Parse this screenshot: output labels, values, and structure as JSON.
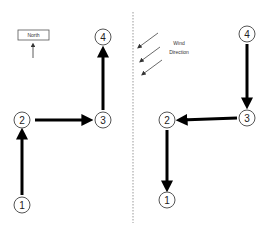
{
  "legend": {
    "north_label": "North",
    "wind_line1": "Wind",
    "wind_line2": "Direction"
  },
  "left_diagram": {
    "nodes": [
      {
        "id": "1",
        "label": "1",
        "x": 22,
        "y": 205
      },
      {
        "id": "2",
        "label": "2",
        "x": 22,
        "y": 120
      },
      {
        "id": "3",
        "label": "3",
        "x": 103,
        "y": 120
      },
      {
        "id": "4",
        "label": "4",
        "x": 103,
        "y": 37
      }
    ],
    "path": [
      "1",
      "2",
      "3",
      "4"
    ]
  },
  "right_diagram": {
    "nodes": [
      {
        "id": "1",
        "label": "1",
        "x": 167,
        "y": 200
      },
      {
        "id": "2",
        "label": "2",
        "x": 167,
        "y": 120
      },
      {
        "id": "3",
        "label": "3",
        "x": 247,
        "y": 118
      },
      {
        "id": "4",
        "label": "4",
        "x": 247,
        "y": 34
      }
    ],
    "path": [
      "4",
      "3",
      "2",
      "1"
    ]
  },
  "colors": {
    "arrow": "#000000",
    "divider": "#999999",
    "circle_stroke": "#555555"
  }
}
